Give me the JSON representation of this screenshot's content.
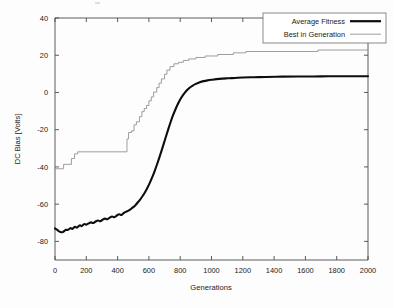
{
  "figure": {
    "background_color": "#fdfdfd",
    "plot_frame_color": "#4a4a4a"
  },
  "chart_data": {
    "type": "line",
    "title": "",
    "xlabel": "Generations",
    "ylabel": "DC Bias [Volts]",
    "xlim": [
      0,
      2000
    ],
    "ylim": [
      -90,
      40
    ],
    "xticks": [
      0,
      200,
      400,
      600,
      800,
      1000,
      1200,
      1400,
      1600,
      1800,
      2000
    ],
    "xtick_labels": [
      "0",
      "200",
      "400",
      "600",
      "800",
      "1000",
      "1200",
      "1400",
      "1600",
      "1800",
      "2000"
    ],
    "yticks": [
      40,
      20,
      0,
      -20,
      -40,
      -60,
      -80
    ],
    "ytick_labels": [
      "40",
      "20",
      "0",
      "-20",
      "-40",
      "-60",
      "-80"
    ],
    "grid": false,
    "legend_position": "upper right",
    "series": [
      {
        "name": "Average Fitness",
        "color": "#0d0d0d",
        "line_width": 2.1,
        "x": [
          0,
          10,
          20,
          30,
          40,
          50,
          60,
          70,
          80,
          90,
          100,
          110,
          120,
          130,
          140,
          150,
          160,
          170,
          180,
          190,
          200,
          215,
          230,
          245,
          260,
          275,
          290,
          305,
          320,
          335,
          350,
          365,
          380,
          395,
          410,
          425,
          440,
          455,
          470,
          485,
          500,
          515,
          530,
          545,
          560,
          575,
          590,
          605,
          620,
          635,
          650,
          665,
          680,
          695,
          710,
          725,
          740,
          755,
          770,
          785,
          800,
          820,
          840,
          860,
          880,
          900,
          925,
          950,
          975,
          1000,
          1050,
          1100,
          1150,
          1200,
          1275,
          1350,
          1450,
          1550,
          1650,
          1750,
          1850,
          1950,
          2000
        ],
        "values": [
          -73.0,
          -73.6,
          -74.2,
          -74.8,
          -75.1,
          -75.0,
          -74.4,
          -73.8,
          -73.9,
          -73.4,
          -72.9,
          -73.3,
          -72.6,
          -72.2,
          -72.6,
          -71.9,
          -71.4,
          -71.8,
          -71.1,
          -70.7,
          -71.0,
          -70.3,
          -69.8,
          -70.1,
          -69.3,
          -68.8,
          -69.2,
          -68.3,
          -67.8,
          -68.1,
          -67.2,
          -66.6,
          -67.0,
          -66.1,
          -65.4,
          -65.8,
          -64.7,
          -64.0,
          -63.5,
          -62.6,
          -61.6,
          -60.4,
          -59.0,
          -57.4,
          -55.6,
          -53.6,
          -51.3,
          -48.7,
          -45.8,
          -42.6,
          -39.1,
          -35.4,
          -31.5,
          -27.5,
          -23.4,
          -19.4,
          -15.6,
          -12.1,
          -9.0,
          -6.2,
          -3.8,
          -1.2,
          0.9,
          2.5,
          3.7,
          4.6,
          5.5,
          6.1,
          6.5,
          6.8,
          7.3,
          7.6,
          7.8,
          8.0,
          8.2,
          8.3,
          8.5,
          8.6,
          8.6,
          8.7,
          8.7,
          8.7,
          8.7
        ]
      },
      {
        "name": "Best in Generation",
        "color": "#8c8c8c",
        "line_width": 0.85,
        "x": [
          0,
          55,
          55,
          105,
          105,
          125,
          125,
          145,
          145,
          460,
          460,
          470,
          470,
          490,
          490,
          505,
          505,
          520,
          520,
          540,
          540,
          555,
          555,
          570,
          570,
          585,
          585,
          600,
          600,
          615,
          615,
          630,
          630,
          650,
          650,
          665,
          665,
          680,
          680,
          700,
          700,
          715,
          715,
          735,
          735,
          760,
          760,
          790,
          790,
          820,
          820,
          855,
          855,
          900,
          900,
          960,
          960,
          1040,
          1040,
          1140,
          1140,
          1220,
          1220,
          1680,
          1680,
          2000
        ],
        "values": [
          -41.0,
          -41.0,
          -38.6,
          -38.6,
          -35.5,
          -35.5,
          -33.0,
          -33.0,
          -31.9,
          -31.9,
          -25.0,
          -25.0,
          -21.5,
          -21.5,
          -20.6,
          -20.6,
          -17.4,
          -17.4,
          -15.8,
          -15.8,
          -13.0,
          -13.0,
          -10.3,
          -10.3,
          -8.6,
          -8.6,
          -7.0,
          -7.0,
          -4.5,
          -4.5,
          -2.4,
          -2.4,
          0.2,
          0.2,
          2.6,
          2.6,
          5.0,
          5.0,
          7.3,
          7.3,
          9.8,
          9.8,
          12.0,
          12.0,
          13.9,
          13.9,
          15.4,
          15.4,
          16.2,
          16.2,
          17.2,
          17.2,
          18.0,
          18.0,
          18.8,
          18.8,
          19.6,
          19.6,
          20.4,
          20.4,
          21.3,
          21.3,
          22.0,
          22.0,
          22.8,
          22.8
        ]
      }
    ]
  },
  "legend": {
    "items": [
      {
        "label": "Average Fitness",
        "style": "thick-black-line"
      },
      {
        "label": "Best in Generation",
        "style": "thin-gray-line"
      }
    ]
  }
}
